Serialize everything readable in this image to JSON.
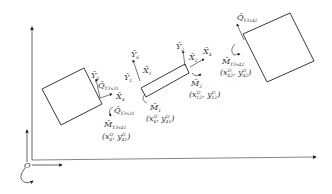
{
  "diagram": {
    "type": "mechanical-free-body",
    "origin_label": "O",
    "global_axes": {
      "x_arrow": true,
      "y_arrow": true,
      "rotation_arrow": true
    },
    "bodies": [
      {
        "id": "left_block",
        "shape": "rotated-square"
      },
      {
        "id": "beam",
        "shape": "rotated-rectangle"
      },
      {
        "id": "right_block",
        "shape": "rotated-square"
      }
    ],
    "labels": {
      "left": {
        "y_axis": "Y",
        "y_axis_sub": "4",
        "shear": "Q",
        "shear_sub": "Y3x31",
        "x_axis": "X",
        "x_axis_sub": "4",
        "shear_lower": "Q",
        "shear_lower_sub": "Y3x31",
        "moment": "M",
        "moment_sub": "Y3x41",
        "coord": "(x",
        "coord_full_a": "x",
        "coord_sup_a": "O",
        "coord_sub_a": "4",
        "coord_full_b": "y",
        "coord_sup_b": "O",
        "coord_sub_b": "41"
      },
      "beam_left": {
        "y_top": "Y",
        "y_top_sub": "6",
        "y_mid": "Y",
        "y_mid_sub": "1",
        "x_mid": "X",
        "x_mid_sub": "1",
        "moment": "M",
        "moment_sub": "1",
        "coord_a": "x",
        "coord_a_sup": "O",
        "coord_a_sub": "4",
        "coord_b": "y",
        "coord_b_sup": "O",
        "coord_b_sub": "41"
      },
      "beam_right": {
        "y_top": "Y",
        "y_top_sub": "2",
        "x_mid": "X",
        "x_mid_sub": "2",
        "x_end": "X",
        "x_end_sub": "4",
        "moment": "M",
        "moment_sub": "2",
        "coord_a": "x",
        "coord_a_sup": "O",
        "coord_a_sub": "12",
        "coord_b": "y",
        "coord_b_sup": "O",
        "coord_b_sub": "12"
      },
      "right": {
        "shear": "Q",
        "shear_sub": "Y3x42",
        "moment": "M",
        "moment_sub": "Y3x42",
        "coord_a": "x",
        "coord_a_sup": "O",
        "coord_a_sub": "42",
        "coord_b": "y",
        "coord_b_sup": "O",
        "coord_b_sub": "42"
      }
    },
    "colors": {
      "stroke": "#222222",
      "text": "#333333",
      "axis": "#555555"
    }
  }
}
